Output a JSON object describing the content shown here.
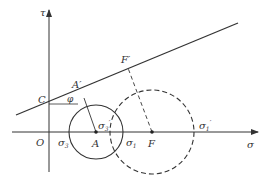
{
  "diagram": {
    "axes": {
      "x_label": "σ",
      "y_label": "τ",
      "origin_label": "O"
    },
    "points": {
      "C": "C",
      "A_prime": "A′",
      "F_prime": "F′",
      "A": "A",
      "F": "F"
    },
    "angle_label": "φ",
    "sigma_labels": {
      "sigma3": "σ",
      "sigma3_sub": "3",
      "sigma1": "σ",
      "sigma1_sub": "1",
      "sigma3_prime": "σ",
      "sigma3_prime_sub": "3",
      "sigma3_prime_mark": "′",
      "sigma1_prime": "σ",
      "sigma1_prime_sub": "1",
      "sigma1_prime_mark": "′"
    },
    "colors": {
      "line": "#333333",
      "background": "#ffffff"
    }
  }
}
